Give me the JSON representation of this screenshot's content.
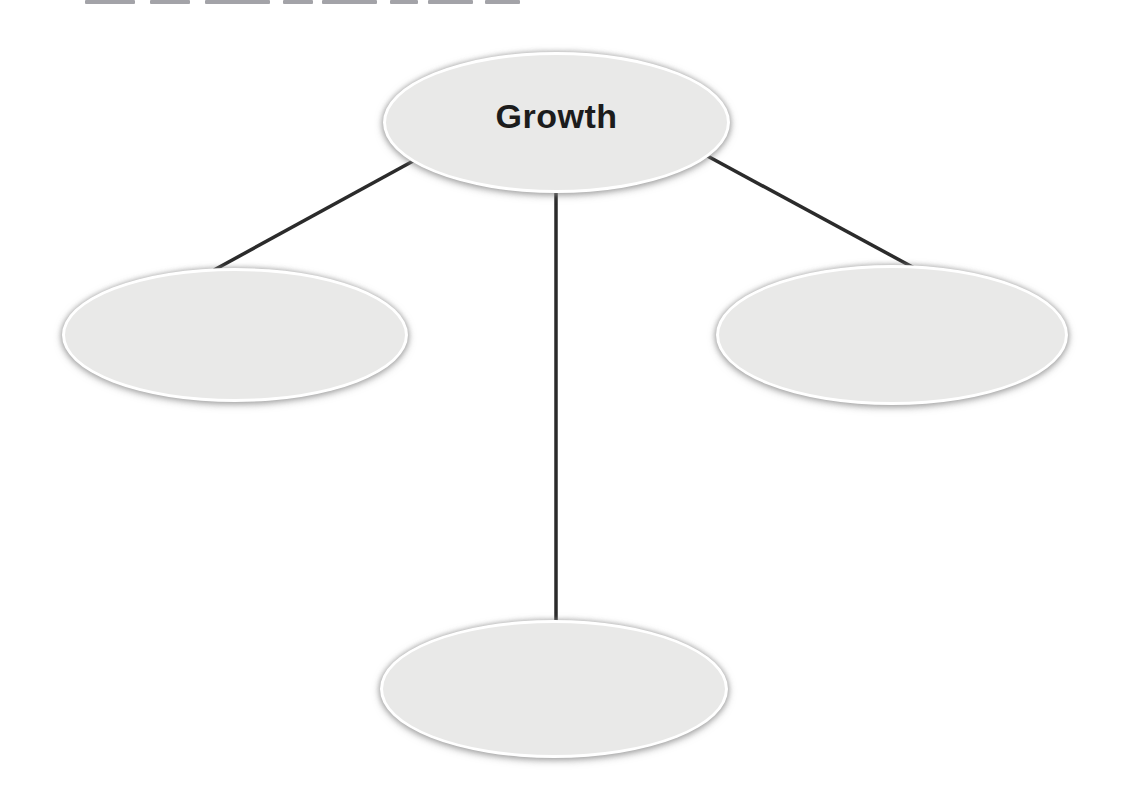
{
  "colors": {
    "page_bg": "#ffffff",
    "node_fill": "#e9e9e8",
    "node_border": "#ffffff",
    "connector": "#2b2b2b",
    "label": "#1c1c1c"
  },
  "diagram": {
    "type": "concept-web",
    "center": {
      "label": "Growth"
    },
    "branches": [
      {
        "position": "left",
        "label": ""
      },
      {
        "position": "right",
        "label": ""
      },
      {
        "position": "bottom",
        "label": ""
      }
    ]
  }
}
